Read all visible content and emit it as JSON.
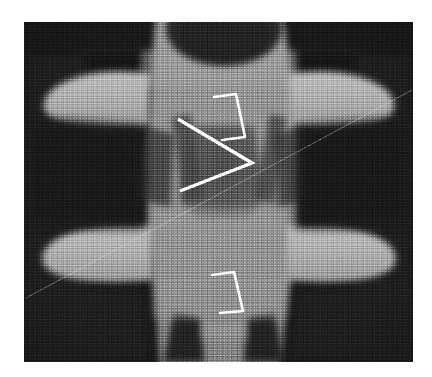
{
  "figure": {
    "kind": "radiograph",
    "modality": "x-ray",
    "view": "anteroposterior",
    "anatomy": "lumbar vertebra",
    "background_color": "#ffffff",
    "plate": {
      "x": 24,
      "y": 22,
      "width": 389,
      "height": 340,
      "film_dark": "#191919",
      "soft_tissue": "#5e5e5e",
      "bone_mid": "#8d8d8d",
      "bone_bright": "#b4b4b4",
      "bone_brightest": "#c8c8c8",
      "cortical_dark": "#3a3a3a"
    },
    "annotations": {
      "marker_color": "#ffffff",
      "items": [
        {
          "name": "cobb-angle-marker",
          "shape": "angle",
          "vertex": [
            252,
            163
          ],
          "arms": [
            [
              178,
              119
            ],
            [
              180,
              191
            ]
          ],
          "stroke_width": 3.4
        },
        {
          "name": "upper-pedicle-outline",
          "shape": "trapezoid",
          "points": [
            [
              214,
              97
            ],
            [
              236,
              94
            ],
            [
              245,
              137
            ],
            [
              222,
              140
            ]
          ],
          "stroke_width": 2.6
        },
        {
          "name": "lower-pedicle-outline",
          "shape": "trapezoid",
          "points": [
            [
              212,
              275
            ],
            [
              234,
              272
            ],
            [
              243,
              311
            ],
            [
              220,
              313
            ]
          ],
          "stroke_width": 2.6
        },
        {
          "name": "scan-artifact-line",
          "shape": "line",
          "from": [
            26,
            298
          ],
          "to": [
            412,
            90
          ],
          "stroke_width": 1.0,
          "opacity": 0.45
        }
      ]
    }
  }
}
